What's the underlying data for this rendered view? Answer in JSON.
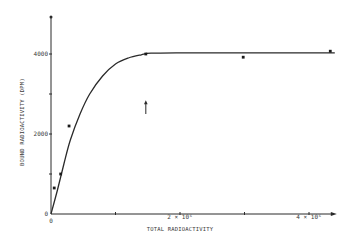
{
  "chart_data": {
    "type": "scatter",
    "title": "",
    "xlabel": "TOTAL RADIOACTIVITY",
    "ylabel": "BOUND RADIOACTIVITY (DPM)",
    "xlim": [
      0,
      4.4
    ],
    "ylim": [
      0,
      4800
    ],
    "x_unit_multiplier": 1000000,
    "grid": false,
    "x_ticks": [
      {
        "value": 0,
        "label": "0"
      },
      {
        "value": 1,
        "label": ""
      },
      {
        "value": 2,
        "label": "2 × 10⁶"
      },
      {
        "value": 3,
        "label": ""
      },
      {
        "value": 4,
        "label": "4 × 10⁶"
      }
    ],
    "y_ticks": [
      {
        "value": 0,
        "label": "0"
      },
      {
        "value": 1000,
        "label": ""
      },
      {
        "value": 2000,
        "label": "2000"
      },
      {
        "value": 3000,
        "label": ""
      },
      {
        "value": 4000,
        "label": "4000"
      }
    ],
    "series": [
      {
        "name": "measured",
        "kind": "points",
        "x": [
          0.05,
          0.15,
          0.28,
          1.47,
          2.98,
          4.33
        ],
        "y": [
          650,
          1000,
          2200,
          4000,
          3920,
          4070
        ]
      },
      {
        "name": "fitted curve",
        "kind": "line",
        "x": [
          0,
          0.1,
          0.2,
          0.3,
          0.45,
          0.6,
          0.8,
          1.0,
          1.2,
          1.4,
          1.55,
          2.0,
          3.0,
          4.4
        ],
        "y": [
          0,
          600,
          1250,
          1850,
          2500,
          3000,
          3450,
          3750,
          3900,
          3980,
          4020,
          4030,
          4030,
          4030
        ]
      }
    ],
    "annotations": [
      {
        "type": "arrow",
        "direction": "up",
        "x": 1.47,
        "y_from": 2500,
        "y_to": 2820
      }
    ]
  }
}
